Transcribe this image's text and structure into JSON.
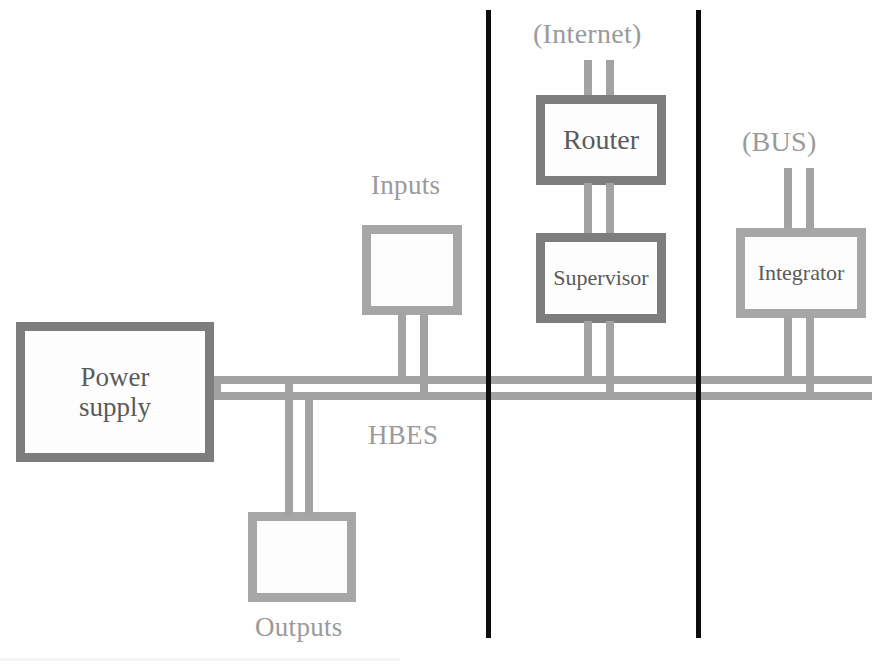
{
  "diagram": {
    "bus_label": "HBES",
    "colors": {
      "box_border_dark": "#7d7d7d",
      "box_border_light": "#a6a6a6",
      "bus_line": "#a3a3a3",
      "divider": "#0d0d0d",
      "label_text": "#5c5c5c",
      "caption_text": "#9a9a9a",
      "background": "#fefefe"
    },
    "nodes": [
      {
        "id": "power-supply",
        "label": "Power supply",
        "label_line1": "Power",
        "label_line2": "supply",
        "style": "dark"
      },
      {
        "id": "inputs",
        "label": "",
        "caption": "Inputs",
        "style": "light"
      },
      {
        "id": "outputs",
        "label": "",
        "caption": "Outputs",
        "style": "light"
      },
      {
        "id": "router",
        "label": "Router",
        "style": "dark"
      },
      {
        "id": "supervisor",
        "label": "Supervisor",
        "style": "dark"
      },
      {
        "id": "integrator",
        "label": "Integrator",
        "style": "light"
      }
    ],
    "captions": {
      "inputs": "Inputs",
      "outputs": "Outputs",
      "hbes": "HBES",
      "internet": "(Internet)",
      "bus": "(BUS)"
    },
    "labels": {
      "power_supply_line1": "Power",
      "power_supply_line2": "supply",
      "router": "Router",
      "supervisor": "Supervisor",
      "integrator": "Integrator"
    },
    "zones": [
      {
        "id": "zone-field-devices",
        "divider_x": 488
      },
      {
        "id": "zone-control",
        "divider_x": 698
      }
    ]
  }
}
